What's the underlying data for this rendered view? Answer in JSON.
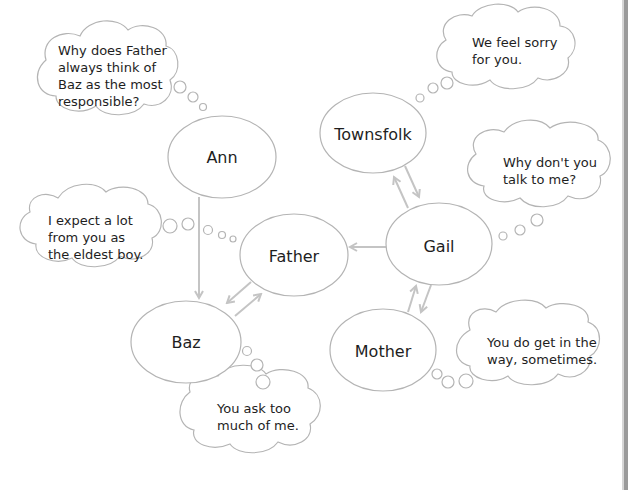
{
  "colors": {
    "stroke": "#b4b4b4",
    "arrow": "#c4c4c4",
    "text": "#1e1e1e",
    "page_edge": "#9a9a9a"
  },
  "nodes": [
    {
      "id": "ann",
      "label": "Ann",
      "cx": 222,
      "cy": 157,
      "rx": 54,
      "ry": 41
    },
    {
      "id": "townsfolk",
      "label": "Townsfolk",
      "cx": 373,
      "cy": 133,
      "rx": 53,
      "ry": 40
    },
    {
      "id": "father",
      "label": "Father",
      "cx": 294,
      "cy": 255,
      "rx": 54,
      "ry": 41
    },
    {
      "id": "gail",
      "label": "Gail",
      "cx": 439,
      "cy": 244,
      "rx": 53,
      "ry": 41
    },
    {
      "id": "baz",
      "label": "Baz",
      "cx": 186,
      "cy": 342,
      "rx": 55,
      "ry": 41
    },
    {
      "id": "mother",
      "label": "Mother",
      "cx": 383,
      "cy": 350,
      "rx": 53,
      "ry": 41
    }
  ],
  "arrows": [
    {
      "from": "Ann",
      "to": "Baz"
    },
    {
      "from": "Father",
      "to": "Baz"
    },
    {
      "from": "Baz",
      "to": "Father"
    },
    {
      "from": "Gail",
      "to": "Father"
    },
    {
      "from": "Gail",
      "to": "Townsfolk"
    },
    {
      "from": "Townsfolk",
      "to": "Gail"
    },
    {
      "from": "Mother",
      "to": "Gail"
    },
    {
      "from": "Gail",
      "to": "Mother"
    }
  ],
  "thoughts": [
    {
      "id": "ann-thought",
      "speaker": "Ann",
      "lines": [
        "Why does Father",
        "always think of",
        "Baz as the most",
        "responsible?"
      ]
    },
    {
      "id": "townsfolk-thought",
      "speaker": "Townsfolk",
      "lines": [
        "We feel sorry",
        "for you."
      ]
    },
    {
      "id": "gail-thought",
      "speaker": "Gail",
      "lines": [
        "Why don't you",
        "talk to me?"
      ]
    },
    {
      "id": "father-thought",
      "speaker": "Father",
      "lines": [
        "I expect a lot",
        "from you as",
        "the eldest boy."
      ]
    },
    {
      "id": "baz-thought",
      "speaker": "Baz",
      "lines": [
        "You ask too",
        "much of me."
      ]
    },
    {
      "id": "mother-thought",
      "speaker": "Mother",
      "lines": [
        "You do get in the",
        "way, sometimes."
      ]
    }
  ]
}
